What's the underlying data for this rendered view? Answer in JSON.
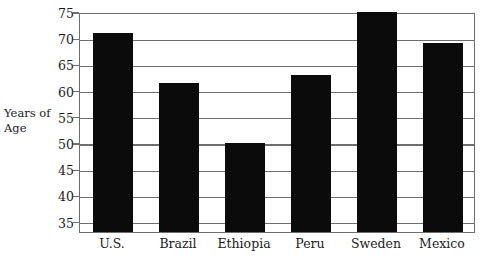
{
  "chart_data": {
    "type": "bar",
    "title": "",
    "xlabel": "",
    "ylabel": "Years of Age",
    "ylabel_lines": [
      "Years of",
      "Age"
    ],
    "categories": [
      "U.S.",
      "Brazil",
      "Ethiopia",
      "Peru",
      "Sweden",
      "Mexico"
    ],
    "values": [
      71,
      61.5,
      50,
      63,
      75,
      69
    ],
    "ylim": [
      33,
      75
    ],
    "yticks": [
      75,
      70,
      65,
      60,
      55,
      50,
      45,
      40,
      35
    ],
    "ytick_labels": [
      "75",
      "70",
      "65",
      "60",
      "55",
      "50",
      "45",
      "40",
      "35"
    ],
    "grid": "horizontal",
    "legend": "none",
    "bar_color": "#0b0b0b",
    "axis_color": "#6e6e6e",
    "background_color": "#ffffff"
  }
}
